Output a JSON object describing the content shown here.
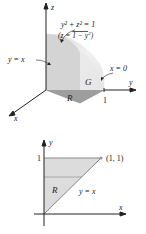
{
  "figure_3d": {
    "axis_z": "z",
    "axis_y": "y",
    "axis_x": "x",
    "surface_label_eq": "y² + z² = 1",
    "surface_label_explicit": "(z = √1 − y²)",
    "surface_label_explicit_parts": {
      "open": "(z = ",
      "root": "1 − y",
      "sup": "2",
      "close": ")"
    },
    "plane_label": "y = x",
    "plane_label_x0": "x = 0",
    "solid_label": "G",
    "region_label": "R",
    "tick_y": "1"
  },
  "figure_2d": {
    "axis_y": "y",
    "axis_x": "x",
    "tick_y": "1",
    "point_label": "(1, 1)",
    "region_label": "R",
    "line_label": "y = x"
  },
  "colors": {
    "solid_light": "#ececec",
    "solid_mid": "#d6d6d6",
    "solid_dark": "#b9b9b9",
    "region_fill": "#dcdcdc",
    "axis": "#222222"
  }
}
